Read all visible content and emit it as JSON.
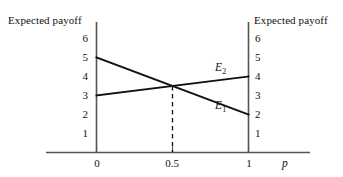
{
  "chart_data": {
    "type": "line",
    "title": "",
    "xlabel": "p",
    "ylabel_left": "Expected payoff",
    "ylabel_right": "Expected payoff",
    "xlim": [
      0,
      1
    ],
    "ylim": [
      0,
      6.6
    ],
    "xticks": [
      0,
      0.5,
      1
    ],
    "xtick_labels": [
      "0",
      "0.5",
      "1"
    ],
    "yticks": [
      1,
      2,
      3,
      4,
      5,
      6
    ],
    "ytick_labels": [
      "1",
      "2",
      "3",
      "4",
      "5",
      "6"
    ],
    "ytick_labels_right": [
      "1",
      "2",
      "3",
      "4",
      "5",
      "6"
    ],
    "grid": false,
    "legend": "inline-labels",
    "series": [
      {
        "name": "E1",
        "label": "E",
        "subscript": "1",
        "x": [
          0,
          1
        ],
        "values": [
          5,
          2
        ],
        "color": "#111111"
      },
      {
        "name": "E2",
        "label": "E",
        "subscript": "2",
        "x": [
          0,
          1
        ],
        "values": [
          3,
          4
        ],
        "color": "#111111"
      }
    ],
    "annotations": [
      {
        "name": "intersection-dropline",
        "type": "dashed-vertical",
        "x": 0.5,
        "y_from": 3.5,
        "y_to": 0,
        "color": "#111111"
      }
    ]
  },
  "labels": {
    "left_axis_title": "Expected payoff",
    "right_axis_title": "Expected payoff",
    "x_axis_variable": "p",
    "series_1_label": "E",
    "series_1_sub": "1",
    "series_2_label": "E",
    "series_2_sub": "2",
    "y_left": {
      "t6": "6",
      "t5": "5",
      "t4": "4",
      "t3": "3",
      "t2": "2",
      "t1": "1"
    },
    "y_right": {
      "t6": "6",
      "t5": "5",
      "t4": "4",
      "t3": "3",
      "t2": "2",
      "t1": "1"
    },
    "x": {
      "x0": "0",
      "x05": "0.5",
      "x1": "1"
    }
  },
  "colors": {
    "ink": "#111111",
    "axis": "#555555",
    "background": "#ffffff"
  }
}
